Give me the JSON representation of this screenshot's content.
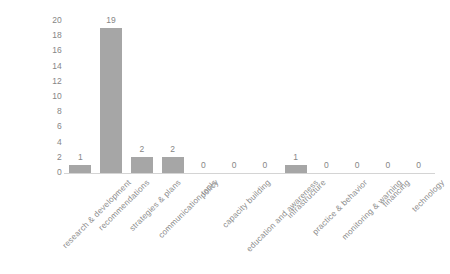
{
  "chart_data": {
    "type": "bar",
    "title": "",
    "subtitle": "",
    "xlabel": "",
    "ylabel": "",
    "categories": [
      "research & development",
      "recommendations",
      "strategies & plans",
      "communication tools",
      "policy",
      "capacity building",
      "education and awareness",
      "infrastructure",
      "practice & behavior",
      "monitoring & warning",
      "financing",
      "technology"
    ],
    "values": [
      1,
      19,
      2,
      2,
      0,
      0,
      0,
      1,
      0,
      0,
      0,
      0
    ],
    "data_labels": [
      "1",
      "19",
      "2",
      "2",
      "0",
      "0",
      "0",
      "1",
      "0",
      "0",
      "0",
      "0"
    ],
    "ylim": [
      0,
      20
    ],
    "ytick_step": 2,
    "ytick_labels": [
      "20",
      "18",
      "16",
      "14",
      "12",
      "10",
      "8",
      "6",
      "4",
      "2",
      "0"
    ],
    "grid": false,
    "legend": false,
    "legend_position": "none",
    "bar_color": "#a6a6a6",
    "text_color": "#868686",
    "axis_color": "#d4d4d4",
    "background_color": "#ffffff"
  }
}
